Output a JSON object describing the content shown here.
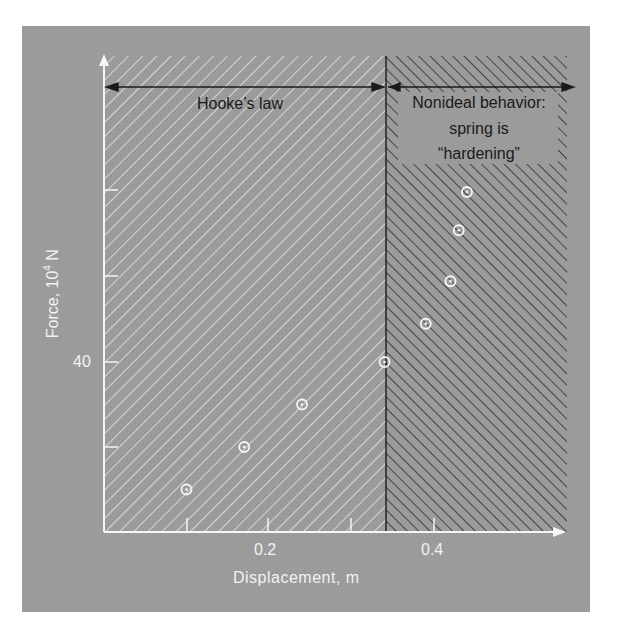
{
  "chart_data": {
    "type": "scatter",
    "title": "",
    "xlabel": "Displacement, m",
    "ylabel": "Force, 10⁴ N",
    "xlim": [
      0,
      0.55
    ],
    "ylim": [
      0,
      100
    ],
    "x_tick_labels": [
      {
        "value": 0.2,
        "label": "0.2"
      },
      {
        "value": 0.4,
        "label": "0.4"
      }
    ],
    "x_ticks": [
      0.1,
      0.2,
      0.3,
      0.4
    ],
    "y_tick_labels": [
      {
        "value": 40,
        "label": "40"
      }
    ],
    "y_ticks": [
      20,
      40,
      60,
      80
    ],
    "grid": false,
    "series": [
      {
        "name": "measurements",
        "marker": "circle-dot",
        "x": [
          0.1,
          0.17,
          0.24,
          0.34,
          0.39,
          0.42,
          0.43,
          0.44
        ],
        "y": [
          10,
          20,
          30,
          40,
          49,
          59,
          71,
          80
        ]
      }
    ],
    "regions": [
      {
        "name": "Hooke's law",
        "x_range": [
          0,
          0.34
        ],
        "fill": "light-hatch"
      },
      {
        "name": "Nonideal behavior: spring is “hardening”",
        "x_range": [
          0.34,
          0.55
        ],
        "fill": "dark-hatch"
      }
    ],
    "annotations": [
      {
        "text": "Hooke’s law",
        "type": "double-arrow",
        "x_range": [
          0,
          0.34
        ]
      },
      {
        "text": "Nonideal behavior:",
        "type": "arrow",
        "x_range": [
          0.34,
          0.55
        ]
      },
      {
        "text": "spring is"
      },
      {
        "text": "“hardening”"
      }
    ]
  },
  "labels": {
    "y_axis": "Force, 10",
    "y_axis_sup": "4",
    "y_axis_unit": " N",
    "x_axis": "Displacement, m",
    "tick_40": "40",
    "tick_02": "0.2",
    "tick_04": "0.4",
    "hooke": "Hooke’s law",
    "nonideal_1": "Nonideal behavior:",
    "nonideal_2": "spring is",
    "nonideal_3": "“hardening”"
  },
  "colors": {
    "panel": "#9b9b9b",
    "light_hatch": "#e6e6e6",
    "dark_hatch": "#1e1e1e",
    "axis": "#f5f5f5",
    "text_dark": "#1a1a1a"
  }
}
